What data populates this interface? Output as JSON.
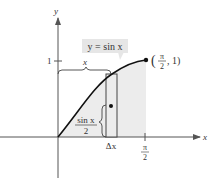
{
  "diagram": {
    "axes": {
      "x_label": "x",
      "y_label": "y"
    },
    "ticks": {
      "y_one": "1",
      "x_pi_num": "π",
      "x_pi_den": "2"
    },
    "curve_label": "y = sin x",
    "point_label": {
      "open": "(",
      "num": "π",
      "den": "2",
      "rest": ", 1)"
    },
    "brace_x_label": "x",
    "sin_half_label": {
      "num": "sin x",
      "den": "2"
    },
    "delta_x_label": "Δx",
    "colors": {
      "shade": "#ececec",
      "axis": "#555555",
      "curve": "#111111",
      "label_box": "#e6e6e6"
    }
  }
}
